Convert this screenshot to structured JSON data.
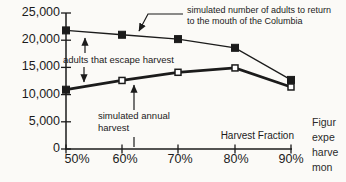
{
  "figure": {
    "background": "#fbfaf7",
    "ink": "#1b1b1b"
  },
  "chart_data": {
    "type": "line",
    "title": "",
    "xlabel": "Harvest Fraction",
    "ylabel": "",
    "categories": [
      "50%",
      "60%",
      "70%",
      "80%",
      "90%"
    ],
    "x_tick_labels": [
      "50%",
      "60%",
      "70%",
      "80%",
      "90%"
    ],
    "ylim": [
      0,
      25000
    ],
    "y_ticks": [
      25000,
      20000,
      15000,
      10000,
      5000,
      0
    ],
    "y_tick_labels": [
      "25,000",
      "20,000",
      "15,000",
      "10,000",
      "5,000",
      "0"
    ],
    "grid": false,
    "legend_position": "inline-annotations",
    "series": [
      {
        "name": "simulated number of adults to return to the mouth of the Columbia",
        "marker": "filled-square",
        "line": "thin",
        "values": [
          21800,
          21000,
          20200,
          18600,
          12700
        ]
      },
      {
        "name": "simulated annual harvest",
        "marker": "open-square",
        "line": "thick",
        "first_marker_filled": true,
        "values": [
          10900,
          12600,
          14100,
          14900,
          11400
        ]
      }
    ]
  },
  "annotations": {
    "return_line1": "simulated number of adults to return",
    "return_line2": "to the mouth of the Columbia",
    "escape": "adults that escape harvest",
    "harvest_line1": "simulated annual",
    "harvest_line2": "harvest"
  },
  "caption": {
    "line1": "Figur",
    "line2": "expe",
    "line3": "harve",
    "line4": "mon"
  }
}
